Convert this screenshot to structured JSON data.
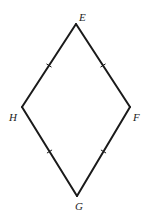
{
  "diagram": {
    "type": "rhombus",
    "stroke_color": "#1a1a1a",
    "stroke_width": 2,
    "vertices": [
      {
        "id": "E",
        "label": "E",
        "x": 76,
        "y": 24,
        "label_x": 79,
        "label_y": 21
      },
      {
        "id": "F",
        "label": "F",
        "x": 130,
        "y": 107,
        "label_x": 133,
        "label_y": 121
      },
      {
        "id": "G",
        "label": "G",
        "x": 77,
        "y": 196,
        "label_x": 75,
        "label_y": 210
      },
      {
        "id": "H",
        "label": "H",
        "x": 22,
        "y": 107,
        "label_x": 9,
        "label_y": 121
      }
    ],
    "sides": [
      {
        "from": "E",
        "to": "F",
        "tick_marks": 1
      },
      {
        "from": "F",
        "to": "G",
        "tick_marks": 1
      },
      {
        "from": "G",
        "to": "H",
        "tick_marks": 1
      },
      {
        "from": "H",
        "to": "E",
        "tick_marks": 1
      }
    ],
    "labels": {
      "E": "E",
      "F": "F",
      "G": "G",
      "H": "H"
    }
  }
}
